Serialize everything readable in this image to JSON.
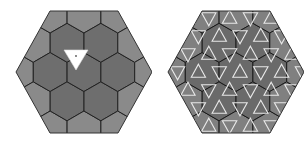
{
  "figure": {
    "panels": [
      {
        "id": "left",
        "description": "Hexagonal region tiled by 19 hexagons with a white triangle marker",
        "outer_shape": "hexagon",
        "tile_count": 19,
        "colors": {
          "light_tile": "#8a8a8a",
          "dark_tile": "#6e6e6e",
          "edge": "#222222",
          "marker": "#ffffff"
        }
      },
      {
        "id": "right",
        "description": "Same hexagonal tiling overlaid with white woven triangle lattice",
        "outer_shape": "hexagon",
        "colors": {
          "tile": "#808080",
          "dark_tile": "#6a6a6a",
          "edge": "#1a1a1a",
          "overlay": "#e8e8e8"
        }
      }
    ]
  }
}
